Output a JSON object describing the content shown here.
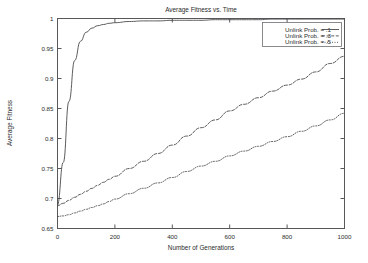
{
  "chart_data": {
    "type": "line",
    "title": "Average Fitness vs. Time",
    "xlabel": "Number of Generations",
    "ylabel": "Average Fitness",
    "xlim": [
      0,
      1000
    ],
    "ylim": [
      0.65,
      1.0
    ],
    "grid": false,
    "legend_position": "top-right",
    "xticks": [
      0,
      200,
      400,
      600,
      800,
      1000
    ],
    "xtick_labels": [
      "0",
      "200",
      "400",
      "600",
      "800",
      "1000"
    ],
    "yticks": [
      0.65,
      0.7,
      0.75,
      0.8,
      0.85,
      0.9,
      0.95,
      1.0
    ],
    "ytick_labels": [
      "0.65",
      "0.7",
      "0.75",
      "0.8",
      "0.85",
      "0.9",
      "0.95",
      "1"
    ],
    "x": [
      0,
      20,
      40,
      60,
      80,
      100,
      120,
      140,
      160,
      180,
      200,
      250,
      300,
      350,
      400,
      450,
      500,
      550,
      600,
      650,
      700,
      750,
      800,
      850,
      900,
      950,
      1000
    ],
    "series": [
      {
        "name": "Unlink Prob. = .1",
        "style": "solid",
        "values": [
          0.688,
          0.76,
          0.862,
          0.93,
          0.962,
          0.977,
          0.984,
          0.988,
          0.99,
          0.992,
          0.993,
          0.995,
          0.996,
          0.996,
          0.997,
          0.997,
          0.997,
          0.998,
          0.998,
          0.998,
          0.998,
          0.999,
          0.999,
          0.999,
          0.999,
          0.999,
          0.999
        ]
      },
      {
        "name": "Unlink Prob. = .3",
        "style": "dashed",
        "values": [
          0.688,
          0.692,
          0.697,
          0.702,
          0.707,
          0.712,
          0.717,
          0.722,
          0.727,
          0.732,
          0.737,
          0.75,
          0.762,
          0.775,
          0.789,
          0.804,
          0.818,
          0.831,
          0.846,
          0.857,
          0.868,
          0.879,
          0.889,
          0.899,
          0.911,
          0.925,
          0.937
        ]
      },
      {
        "name": "Unlink Prob. = .5",
        "style": "dotted",
        "values": [
          0.67,
          0.671,
          0.673,
          0.676,
          0.679,
          0.682,
          0.685,
          0.688,
          0.691,
          0.695,
          0.699,
          0.708,
          0.717,
          0.726,
          0.735,
          0.745,
          0.754,
          0.762,
          0.771,
          0.779,
          0.787,
          0.795,
          0.803,
          0.812,
          0.821,
          0.831,
          0.842
        ]
      }
    ]
  }
}
